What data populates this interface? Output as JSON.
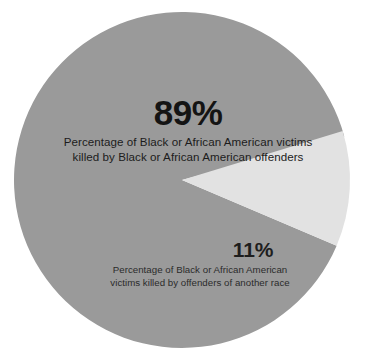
{
  "chart_data": {
    "type": "pie",
    "title": "",
    "subtitle": "",
    "legend_position": "none",
    "grid": false,
    "categories": [
      "Percentage of Black or African American victims killed by Black or African American offenders",
      "Percentage of Black or African American victims killed by offenders of another race"
    ],
    "values": [
      89,
      11
    ],
    "value_labels": [
      "89%",
      "11%"
    ],
    "units": "percent",
    "total": 100,
    "slices": [
      {
        "id": "major",
        "value": 89,
        "value_label": "89%",
        "caption_line1": "Percentage of Black or African American victims",
        "caption_line2": "killed by Black or African American offenders",
        "color": "#9a9a9a",
        "start_angle_deg": 113,
        "end_angle_deg": 435
      },
      {
        "id": "minor",
        "value": 11,
        "value_label": "11%",
        "caption_line1": "Percentage of Black or African American",
        "caption_line2": "victims killed by offenders of another race",
        "color": "#e2e2e2",
        "start_angle_deg": 73,
        "end_angle_deg": 113
      }
    ],
    "colors": {
      "major_slice": "#9a9a9a",
      "minor_slice": "#e2e2e2",
      "background": "#ffffff",
      "major_text": "#141414",
      "minor_text": "#1e1e1e"
    },
    "geometry": {
      "center_x": 182,
      "center_y": 180,
      "radius": 168
    }
  }
}
